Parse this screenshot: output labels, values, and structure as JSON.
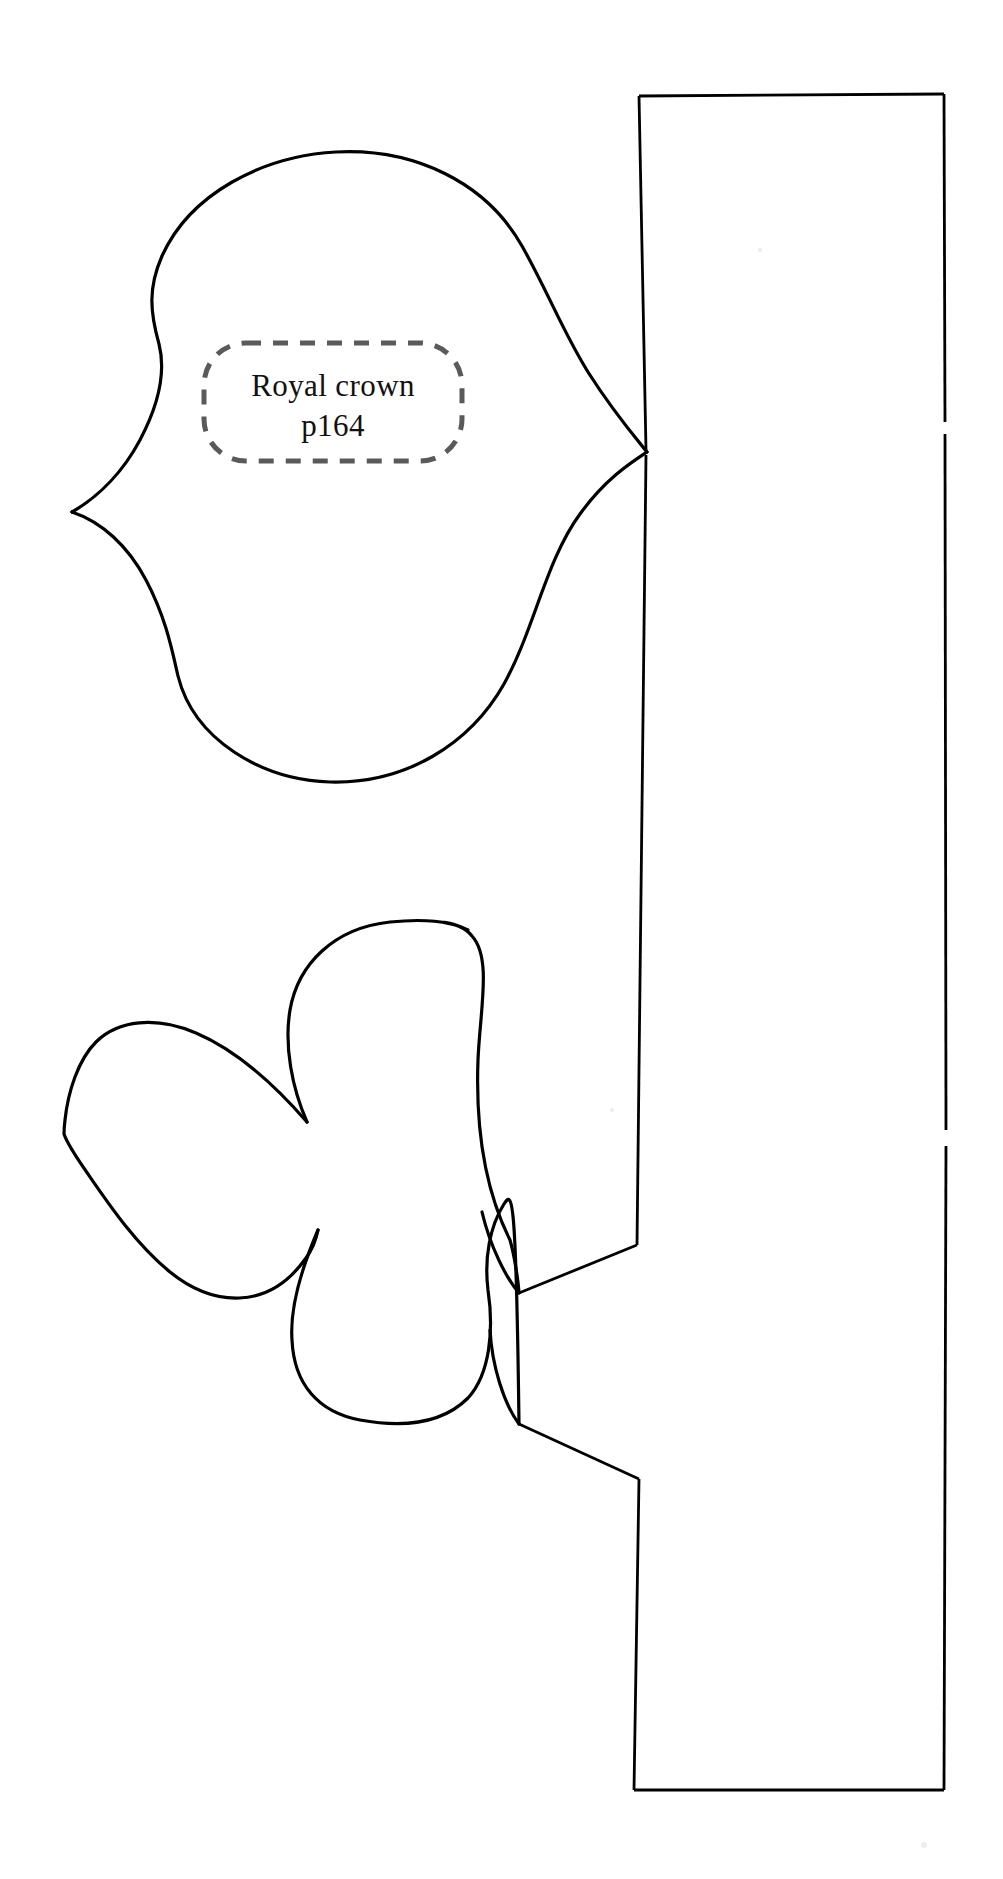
{
  "document": {
    "kind": "sewing-pattern-template",
    "background_color": "#ffffff",
    "ink_color": "#000000",
    "guide_color": "#5a5a5a",
    "width": 1003,
    "height": 1879
  },
  "label": {
    "line1": "Royal crown",
    "line2": "p164",
    "box_style": "dashed-rounded-rectangle",
    "box_color": "#5a5a5a",
    "text_color": "#111111"
  },
  "shapes": [
    {
      "name": "leaf-heart-piece",
      "description": "Sideways heart / spade leaf with pointed left tip, joined at right to the strip",
      "outline": "M 648 432 C 612 404 577 358 555 300 C 524 222 464 168 390 154 C 300 137 212 168 166 241 C 146 273 148 306 158 333 C 168 359 160 392 138 428 C 115 465 92 492 72 512 C 96 516 122 537 149 574 C 180 617 186 650 203 672 C 254 739 372 713 441 657 C 509 602 548 525 570 472 C 592 419 620 397 648 455 Z"
    },
    {
      "name": "clover-flower-piece",
      "description": "Three-lobed clover / flower with left pointed tip, joined at right to the strip by two notch points",
      "outline": "M 520 1290 C 478 1254 466 1206 468 1157 C 472 1092 482 1030 455 985 C 426 937 366 919 330 921 C 285 923 301 924 268 962 C 235 1000 287 1075 307 1122 C 253 1063 173 1014 128 1028 C 84 1042 64 1100 64 1134 C 64 1168 86 1220 120 1260 C 152 1298 232 1310 305 1230 C 288 1286 278 1322 296 1356 C 318 1396 357 1362 392 1360 C 442 1358 470 1328 479 1288 Z"
    },
    {
      "name": "right-strip-piece",
      "description": "Tall vertical rectangle strip on the right edge with two notch gaps on its right side"
    }
  ],
  "strip": {
    "left_x": 636,
    "right_x": 944,
    "top_y": 96,
    "bottom_y": 1790,
    "notch_y_upper": 430,
    "notch_y_lower": 1140
  }
}
